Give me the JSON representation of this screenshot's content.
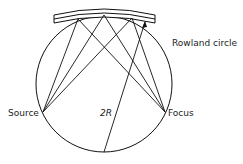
{
  "labels": {
    "rowland": "Rowland circle",
    "source": "Source",
    "focus": "Focus",
    "radius": "2R"
  }
}
